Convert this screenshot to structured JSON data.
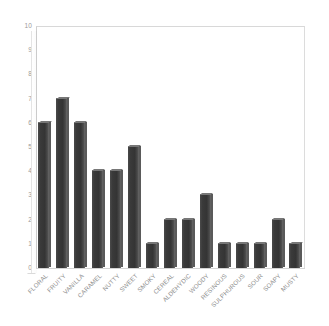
{
  "chart_data": {
    "type": "bar",
    "title": "",
    "subtitle": "",
    "xlabel": "",
    "ylabel": "",
    "ylim": [
      0,
      10
    ],
    "yticks": [
      0,
      1,
      2,
      3,
      4,
      5,
      6,
      7,
      8,
      9,
      10
    ],
    "grid": false,
    "legend": null,
    "bar_color": "#3a3a3a",
    "axis_color": "#cfcfcf",
    "tick_label_color": "#9a9a9a",
    "categories": [
      "FLORAL",
      "FRUITY",
      "VANILLA",
      "CARAMEL",
      "NUTTY",
      "SWEET",
      "SMOKY",
      "CEREAL",
      "ALDEHYDIC",
      "WOODY",
      "RESINOUS",
      "SULPHUROUS",
      "SOUR",
      "SOAPY",
      "MUSTY"
    ],
    "values": [
      6,
      7,
      6,
      4,
      4,
      5,
      1,
      2,
      2,
      3,
      1,
      1,
      1,
      2,
      1
    ]
  }
}
